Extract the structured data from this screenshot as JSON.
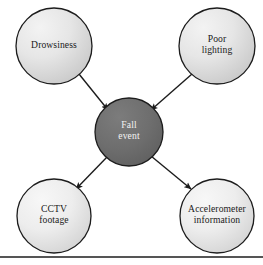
{
  "diagram": {
    "type": "hub-and-spoke concept diagram",
    "background_color": "#ffffff",
    "center_node": {
      "id": "fall-event",
      "label": "Fall\nevent",
      "line1": "Fall",
      "line2": "event",
      "fill_color": "#6e6e6e",
      "stroke_color": "#1c1c1c",
      "text_color": "#f2f2f2",
      "cx": 129,
      "cy": 132,
      "r": 34
    },
    "nodes": [
      {
        "id": "drowsiness",
        "label": "Drowsiness",
        "line1": "Drowsiness",
        "line2": "",
        "position": "top-left",
        "fill_color": "#e0e0e0",
        "stroke_color": "#1c1c1c",
        "text_color": "#1a1a1a",
        "cx": 54,
        "cy": 46,
        "r": 38
      },
      {
        "id": "poor-lighting",
        "label": "Poor\nlighting",
        "line1": "Poor",
        "line2": "lighting",
        "position": "top-right",
        "fill_color": "#e0e0e0",
        "stroke_color": "#1c1c1c",
        "text_color": "#1a1a1a",
        "cx": 217,
        "cy": 46,
        "r": 38
      },
      {
        "id": "cctv-footage",
        "label": "CCTV\nfootage",
        "line1": "CCTV",
        "line2": "footage",
        "position": "bottom-left",
        "fill_color": "#e8e8e8",
        "stroke_color": "#1c1c1c",
        "text_color": "#1a1a1a",
        "cx": 54,
        "cy": 216,
        "r": 37
      },
      {
        "id": "accelerometer-information",
        "label": "Accelerometer\ninformation",
        "line1": "Accelerometer",
        "line2": "information",
        "position": "bottom-right",
        "fill_color": "#e8e8e8",
        "stroke_color": "#1c1c1c",
        "text_color": "#1a1a1a",
        "cx": 217,
        "cy": 216,
        "r": 37
      }
    ],
    "edges": [
      {
        "id": "edge-drowsiness-to-fall",
        "from": "drowsiness",
        "to": "fall-event",
        "direction": "to-center",
        "arrowhead": "filled-triangle",
        "color": "#1c1c1c"
      },
      {
        "id": "edge-poor-lighting-to-fall",
        "from": "poor-lighting",
        "to": "fall-event",
        "direction": "to-center",
        "arrowhead": "filled-triangle",
        "color": "#1c1c1c"
      },
      {
        "id": "edge-fall-to-cctv",
        "from": "fall-event",
        "to": "cctv-footage",
        "direction": "from-center",
        "arrowhead": "filled-triangle",
        "color": "#1c1c1c"
      },
      {
        "id": "edge-fall-to-accelerometer",
        "from": "fall-event",
        "to": "accelerometer-information",
        "direction": "from-center",
        "arrowhead": "filled-triangle",
        "color": "#1c1c1c"
      }
    ],
    "footer_rule": {
      "id": "footer-rule",
      "color": "#1c1c1c",
      "y": 257
    }
  }
}
